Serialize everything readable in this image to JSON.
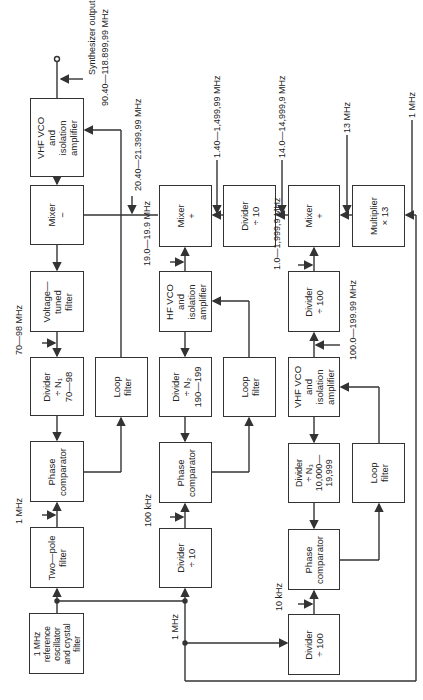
{
  "diagram": {
    "blocks": [
      {
        "id": "vhf-vco-out",
        "lines": [
          "VHF VCO",
          "and",
          "isolation",
          "amplifier"
        ],
        "x": 30,
        "y": 98,
        "w": 54,
        "h": 79
      },
      {
        "id": "mixer-minus",
        "lines": [
          "Mixer",
          "−"
        ],
        "x": 30,
        "y": 185,
        "w": 54,
        "h": 60
      },
      {
        "id": "voltage-tuned-filter",
        "lines": [
          "Voltage—",
          "tuned",
          "filter"
        ],
        "x": 30,
        "y": 271,
        "w": 54,
        "h": 61
      },
      {
        "id": "divider-n1",
        "lines": [
          "Divider",
          "÷ N₁",
          "70—98"
        ],
        "x": 30,
        "y": 357,
        "w": 54,
        "h": 59
      },
      {
        "id": "phase-comp-1",
        "lines": [
          "Phase",
          "comparator"
        ],
        "x": 30,
        "y": 441,
        "w": 54,
        "h": 61
      },
      {
        "id": "two-pole-filter",
        "lines": [
          "Two—pole",
          "filter"
        ],
        "x": 30,
        "y": 527,
        "w": 54,
        "h": 61
      },
      {
        "id": "ref-osc",
        "lines": [
          "1 MHz",
          "reference",
          "oscillator",
          "and crystal",
          "filter"
        ],
        "x": 29,
        "y": 613,
        "w": 55,
        "h": 61
      },
      {
        "id": "loop-filter-1",
        "lines": [
          "Loop",
          "filter"
        ],
        "x": 95,
        "y": 357,
        "w": 53,
        "h": 60
      },
      {
        "id": "mixer-plus-1",
        "lines": [
          "Mixer",
          "+"
        ],
        "x": 159,
        "y": 185,
        "w": 53,
        "h": 62
      },
      {
        "id": "hf-vco",
        "lines": [
          "HF VCO",
          "and",
          "isolation",
          "amplifier"
        ],
        "x": 159,
        "y": 271,
        "w": 53,
        "h": 61
      },
      {
        "id": "divider-n2",
        "lines": [
          "Divider",
          "÷ N₂",
          "190—199"
        ],
        "x": 159,
        "y": 357,
        "w": 53,
        "h": 60
      },
      {
        "id": "phase-comp-2",
        "lines": [
          "Phase",
          "comparator"
        ],
        "x": 159,
        "y": 442,
        "w": 53,
        "h": 61
      },
      {
        "id": "divider-10-low",
        "lines": [
          "Divider",
          "÷ 10"
        ],
        "x": 159,
        "y": 528,
        "w": 53,
        "h": 60
      },
      {
        "id": "divider-10-top",
        "lines": [
          "Divider",
          "÷ 10"
        ],
        "x": 223,
        "y": 185,
        "w": 53,
        "h": 62
      },
      {
        "id": "loop-filter-2",
        "lines": [
          "Loop",
          "filter"
        ],
        "x": 223,
        "y": 357,
        "w": 53,
        "h": 60
      },
      {
        "id": "mixer-plus-2",
        "lines": [
          "Mixer",
          "+"
        ],
        "x": 288,
        "y": 185,
        "w": 52,
        "h": 62
      },
      {
        "id": "divider-100-top",
        "lines": [
          "Divider",
          "÷ 100"
        ],
        "x": 288,
        "y": 271,
        "w": 52,
        "h": 61
      },
      {
        "id": "vhf-vco-2",
        "lines": [
          "VHF VCO",
          "and",
          "isolation",
          "amplifier"
        ],
        "x": 288,
        "y": 357,
        "w": 52,
        "h": 60
      },
      {
        "id": "divider-n3",
        "lines": [
          "Divider",
          "÷ N₃",
          "10,000—",
          "19,999"
        ],
        "x": 288,
        "y": 443,
        "w": 52,
        "h": 60
      },
      {
        "id": "phase-comp-3",
        "lines": [
          "Phase",
          "comparator"
        ],
        "x": 288,
        "y": 529,
        "w": 52,
        "h": 61
      },
      {
        "id": "divider-100-low",
        "lines": [
          "Divider",
          "÷ 100"
        ],
        "x": 288,
        "y": 614,
        "w": 52,
        "h": 61
      },
      {
        "id": "multiplier-13",
        "lines": [
          "Multiplier",
          "× 13"
        ],
        "x": 352,
        "y": 185,
        "w": 53,
        "h": 62
      },
      {
        "id": "loop-filter-3",
        "lines": [
          "Loop",
          "filter"
        ],
        "x": 352,
        "y": 443,
        "w": 53,
        "h": 60
      }
    ],
    "labels": [
      {
        "id": "synth-output",
        "text": "Synthesizer output",
        "x": 90,
        "y": 75
      },
      {
        "id": "synth-output-range",
        "text": "90.40—118.899,99 MHz",
        "x": 104,
        "y": 103
      },
      {
        "id": "f-20-40",
        "text": "20.40—21.399,99 MHz",
        "x": 137,
        "y": 188
      },
      {
        "id": "f-1-40",
        "text": "1.40—1,499,99 MHz",
        "x": 216,
        "y": 155
      },
      {
        "id": "f-14-0",
        "text": "14.0—14,999,9 MHz",
        "x": 281,
        "y": 155
      },
      {
        "id": "f-13",
        "text": "13 MHz",
        "x": 346,
        "y": 130
      },
      {
        "id": "f-1-mhz-mult",
        "text": "1 MHz",
        "x": 411,
        "y": 115
      },
      {
        "id": "f-19-0",
        "text": "19.0—19.9 MHz",
        "x": 146,
        "y": 262
      },
      {
        "id": "f-1-0",
        "text": "1.0—1,999,9 MHz",
        "x": 276,
        "y": 266
      },
      {
        "id": "f-100-0",
        "text": "100.0—199.99 MHz",
        "x": 352,
        "y": 356
      },
      {
        "id": "f-70-98",
        "text": "70—98 MHz",
        "x": 17,
        "y": 351
      },
      {
        "id": "f-1-mhz-pc1",
        "text": "1 MHz",
        "x": 17,
        "y": 521
      },
      {
        "id": "f-100-khz",
        "text": "100 kHz",
        "x": 147,
        "y": 523
      },
      {
        "id": "f-1-mhz-bus",
        "text": "1 MHz",
        "x": 174,
        "y": 637
      },
      {
        "id": "f-10-khz",
        "text": "10 kHz",
        "x": 278,
        "y": 608
      }
    ]
  }
}
